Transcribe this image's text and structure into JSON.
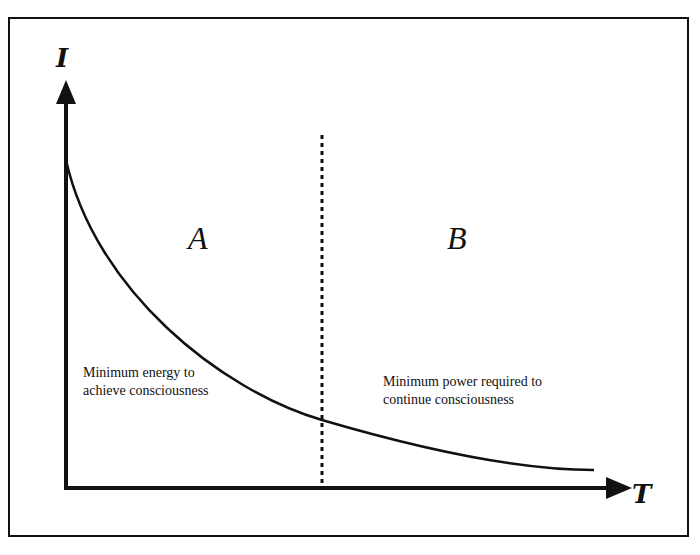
{
  "diagram": {
    "y_axis_label": "I",
    "x_axis_label": "T",
    "regions": [
      {
        "id": "A",
        "label": "A"
      },
      {
        "id": "B",
        "label": "B"
      }
    ],
    "annotations": {
      "region_a_line1": "Minimum energy to",
      "region_a_line2": "achieve consciousness",
      "region_b_line1": "Minimum power required to",
      "region_b_line2": "continue consciousness"
    },
    "curve": {
      "description": "Monotonically decreasing convex curve of I versus T, asymptotically approaching the T axis",
      "points_px": [
        [
          66,
          168
        ],
        [
          100,
          235
        ],
        [
          140,
          290
        ],
        [
          180,
          338
        ],
        [
          230,
          380
        ],
        [
          280,
          405
        ],
        [
          322,
          420
        ],
        [
          380,
          440
        ],
        [
          440,
          455
        ],
        [
          500,
          465
        ],
        [
          593,
          470
        ]
      ]
    },
    "divider": {
      "style": "dotted vertical line",
      "x_px": 322
    },
    "colors": {
      "ink": "#111111",
      "background": "#ffffff"
    }
  }
}
